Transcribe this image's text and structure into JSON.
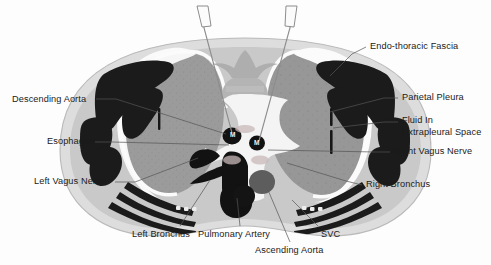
{
  "figure": {
    "modality": "CT cross-section",
    "colors": {
      "background": "#fdfdfd",
      "body_wall_outer": "#dcdcdc",
      "body_wall_inner": "#c4c4c4",
      "lung_field": "#9a9a9a",
      "dense_tissue": "#1b1b1b",
      "fluid_white": "#fbfbfb",
      "vertebra": "#b0b0b0",
      "leader_line": "#4a4a4a",
      "text": "#1a1a1a"
    }
  },
  "labels": {
    "left": [
      {
        "id": "descending-aorta",
        "text": "Descending Aorta",
        "x": 12,
        "y": 96,
        "anchor_x": 234,
        "anchor_y": 134
      },
      {
        "id": "esophagus",
        "text": "Esophagus",
        "x": 47,
        "y": 138,
        "anchor_x": 232,
        "anchor_y": 146
      },
      {
        "id": "left-vagus-nerve",
        "text": "Left Vagus Nerve",
        "x": 35,
        "y": 178,
        "anchor_x": 196,
        "anchor_y": 160
      }
    ],
    "right": [
      {
        "id": "endo-thoracic-fascia",
        "text": "Endo-thoracic Fascia",
        "x": 370,
        "y": 44,
        "anchor_x": 334,
        "anchor_y": 72
      },
      {
        "id": "parietal-pleura",
        "text": "Parietal Pleura",
        "x": 402,
        "y": 95,
        "anchor_x": 330,
        "anchor_y": 112
      },
      {
        "id": "fluid-in",
        "text": "Fluid In",
        "x": 402,
        "y": 117,
        "anchor_x": 332,
        "anchor_y": 126
      },
      {
        "id": "extrapleural-space",
        "text": "Extrapleural Space",
        "x": 402,
        "y": 129,
        "anchor_x": 0,
        "anchor_y": 0
      },
      {
        "id": "right-vagus-nerve",
        "text": "Right Vagus Nerve",
        "x": 394,
        "y": 149,
        "anchor_x": 268,
        "anchor_y": 150
      },
      {
        "id": "right-bronchus",
        "text": "Right Bronchus",
        "x": 366,
        "y": 182,
        "anchor_x": 286,
        "anchor_y": 165
      }
    ],
    "bottom": [
      {
        "id": "left-bronchus",
        "text": "Left Bronchus",
        "x": 133,
        "y": 232,
        "anchor_x": 214,
        "anchor_y": 178
      },
      {
        "id": "pulmonary-artery",
        "text": "Pulmonary Artery",
        "x": 198,
        "y": 232,
        "anchor_x": 237,
        "anchor_y": 196
      },
      {
        "id": "svc",
        "text": "SVC",
        "x": 322,
        "y": 232,
        "anchor_x": 268,
        "anchor_y": 196
      },
      {
        "id": "ascending-aorta",
        "text": "Ascending Aorta",
        "x": 255,
        "y": 248,
        "anchor_x": 262,
        "anchor_y": 186
      }
    ],
    "inline_markers": [
      {
        "id": "marker-m-left",
        "text": "M",
        "x": 233,
        "y": 133
      },
      {
        "id": "marker-m-right",
        "text": "M",
        "x": 256,
        "y": 141
      }
    ]
  },
  "instruments": [
    {
      "id": "needle-left",
      "tip_x": 232,
      "tip_y": 132,
      "hub_x": 202,
      "hub_y": 8
    },
    {
      "id": "needle-right",
      "tip_x": 258,
      "tip_y": 140,
      "hub_x": 292,
      "hub_y": 8
    }
  ]
}
